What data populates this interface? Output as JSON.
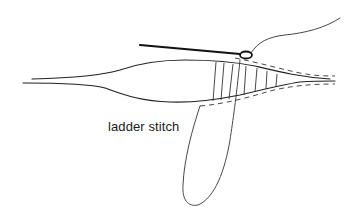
{
  "figure": {
    "label": "ladder stitch",
    "elements": [
      {
        "name": "fabric-upper-edge"
      },
      {
        "name": "fabric-lower-edge"
      },
      {
        "name": "needle"
      },
      {
        "name": "needle-eye"
      },
      {
        "name": "thread-tail"
      },
      {
        "name": "ladder-stitches"
      },
      {
        "name": "thread-loop"
      }
    ],
    "colors": {
      "line": "#222222",
      "background": "#ffffff"
    }
  }
}
